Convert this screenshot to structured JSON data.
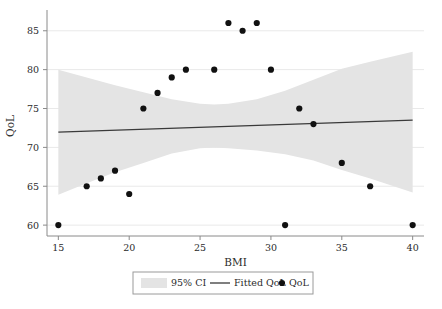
{
  "chart_data": {
    "type": "scatter",
    "title": "",
    "xlabel": "BMI",
    "ylabel": "QoL",
    "xlim": [
      14.2,
      40.8
    ],
    "ylim": [
      58.6,
      86.9
    ],
    "xticks": [
      15,
      20,
      25,
      30,
      35,
      40
    ],
    "yticks": [
      60,
      65,
      70,
      75,
      80,
      85
    ],
    "grid": "horizontal",
    "legend_position": "bottom-center",
    "legend": [
      "95% CI",
      "Fitted QoL",
      "QoL"
    ],
    "series": [
      {
        "name": "QoL",
        "type": "scatter",
        "marker": "circle",
        "color": "#111111",
        "x": [
          15,
          17,
          18,
          19,
          20,
          21,
          22,
          23,
          24,
          26,
          27,
          28,
          29,
          30,
          31,
          32,
          33,
          35,
          37,
          40
        ],
        "y": [
          60,
          65,
          66,
          67,
          64,
          75,
          77,
          79,
          80,
          80,
          86,
          85,
          86,
          80,
          60,
          75,
          73,
          68,
          65,
          60
        ]
      },
      {
        "name": "Fitted QoL",
        "type": "line",
        "color": "#3a3a3a",
        "x": [
          15,
          40
        ],
        "y": [
          71.95,
          73.5
        ]
      },
      {
        "name": "95% CI",
        "type": "band",
        "color": "#e4e4e4",
        "x": [
          15,
          17,
          19,
          21,
          23,
          25,
          26,
          27,
          29,
          31,
          33,
          35,
          37,
          40
        ],
        "upper": [
          80.0,
          79.0,
          78.0,
          77.1,
          76.2,
          75.6,
          75.5,
          75.6,
          76.2,
          77.3,
          78.7,
          80.1,
          81.0,
          82.3
        ],
        "lower": [
          63.9,
          65.4,
          66.8,
          68.0,
          69.2,
          69.9,
          70.0,
          69.9,
          69.6,
          69.1,
          68.3,
          67.1,
          66.0,
          64.2
        ]
      }
    ]
  },
  "axes": {
    "x_title": "BMI",
    "y_title": "QoL",
    "x_tick_labels": [
      "15",
      "20",
      "25",
      "30",
      "35",
      "40"
    ],
    "y_tick_labels": [
      "60",
      "65",
      "70",
      "75",
      "80",
      "85"
    ]
  },
  "legend": {
    "ci_label": "95% CI",
    "fit_label": "Fitted QoL",
    "points_label": "QoL"
  },
  "colors": {
    "ci_band": "#e4e4e4",
    "fit_line": "#3a3a3a",
    "marker": "#111111",
    "grid": "#e9e9e9",
    "axis": "#8a8a8a",
    "background": "#ffffff"
  }
}
